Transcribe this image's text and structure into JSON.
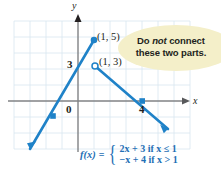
{
  "figure": {
    "type": "piecewise-function-graph",
    "axes": {
      "x_axis_label": "x",
      "y_axis_label": "y",
      "origin_label": "0",
      "y_tick_label": "3",
      "x_tick_label": "4",
      "x_range": [
        -4,
        6
      ],
      "y_range": [
        -3,
        6
      ],
      "grid": true,
      "grid_color": "#d7e4ef",
      "axis_color": "#808285"
    },
    "curve_color": "#1f82c8",
    "points": [
      {
        "label": "(1, 5)",
        "x": 1,
        "y": 5,
        "marker": "filled"
      },
      {
        "label": "(1, 3)",
        "x": 1,
        "y": 3,
        "marker": "open"
      },
      {
        "label": "",
        "x": -1.5,
        "y": 0,
        "marker": "filled"
      },
      {
        "label": "",
        "x": 4,
        "y": 0,
        "marker": "filled"
      }
    ],
    "segments": [
      {
        "name": "left-branch",
        "equation": "2x + 3 if x ≤ 1",
        "from": [
          -2.6,
          -2.2
        ],
        "to": [
          1,
          5
        ],
        "arrow_start": true
      },
      {
        "name": "right-branch",
        "equation": "-x + 4 if x > 1",
        "from": [
          1,
          3
        ],
        "to": [
          5.6,
          -1.6
        ],
        "arrow_end": true
      }
    ],
    "callout": {
      "line1_pre": "Do ",
      "line1_em": "not",
      "line1_post": " connect",
      "line2": "these two parts.",
      "fill": "#f4efc9"
    },
    "formula": {
      "name": "f(x)",
      "equals": "=",
      "case1": "2x + 3 if x ≤ 1",
      "case2": "−x + 4 if x > 1",
      "case1_parts": {
        "expr": "2x + 3",
        "cond": "if x ≤ 1"
      },
      "case2_parts": {
        "expr": "−x + 4",
        "cond": "if x > 1"
      },
      "color": "#1f6fb5"
    }
  }
}
